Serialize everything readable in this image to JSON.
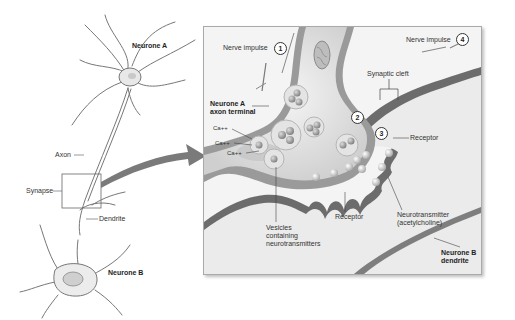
{
  "diagram": {
    "overview": {
      "neurone_a": "Neurone A",
      "neurone_b": "Neurone B",
      "axon": "Axon",
      "synapse": "Synapse",
      "dendrite": "Dendrite"
    },
    "detail": {
      "nerve_impulse_1": "Nerve impulse",
      "step_1": "1",
      "nerve_impulse_4": "Nerve impulse",
      "step_4": "4",
      "step_2": "2",
      "step_3": "3",
      "synaptic_cleft": "Synaptic cleft",
      "axon_terminal_line1": "Neurone A",
      "axon_terminal_line2": "axon terminal",
      "ca_1": "Ca++",
      "ca_2": "Ca++",
      "ca_3": "Ca++",
      "receptor_right": "Receptor",
      "receptor_bottom": "Receptor",
      "neurotransmitter_line1": "Neurotransmitter",
      "neurotransmitter_line2": "(acetylcholine)",
      "vesicles_line1": "Vesicles",
      "vesicles_line2": "containing",
      "vesicles_line3": "neurotransmitters",
      "dendrite_b_line1": "Neurone B",
      "dendrite_b_line2": "dendrite"
    },
    "colors": {
      "membrane": "#8a8a8a",
      "cleft": "#6f6f6f",
      "frame_bg": "#f4f4f4",
      "arrow": "#7a7a7a"
    }
  }
}
